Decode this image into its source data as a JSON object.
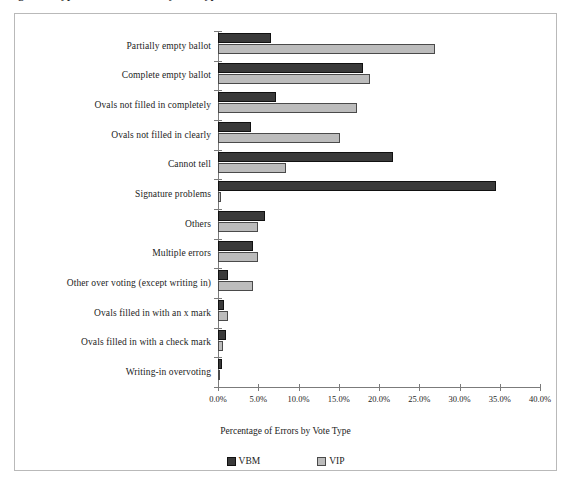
{
  "clipped_caption": "Figure 6. Types of ballot errors by vote type",
  "chart_data": {
    "type": "bar",
    "orientation": "horizontal",
    "title": "",
    "xlabel": "Percentage of Errors by Vote Type",
    "ylabel": "",
    "xlim": [
      0,
      40
    ],
    "xtick_labels": [
      "0.0%",
      "5.0%",
      "10.0%",
      "15.0%",
      "20.0%",
      "25.0%",
      "30.0%",
      "35.0%",
      "40.0%"
    ],
    "xticks": [
      0,
      5,
      10,
      15,
      20,
      25,
      30,
      35,
      40
    ],
    "grid": false,
    "legend_position": "bottom",
    "categories": [
      "Partially empty ballot",
      "Complete empty ballot",
      "Ovals not filled in completely",
      "Ovals not filled in clearly",
      "Cannot tell",
      "Signature problems",
      "Others",
      "Multiple errors",
      "Other over voting (except writing in)",
      "Ovals filled in with an x mark",
      "Ovals filled in with a check mark",
      "Writing-in overvoting"
    ],
    "series": [
      {
        "name": "VBM",
        "color": "#3A3A3A",
        "values": [
          6.6,
          18.0,
          7.2,
          4.1,
          21.7,
          34.5,
          5.8,
          4.4,
          1.2,
          0.7,
          1.0,
          0.5
        ]
      },
      {
        "name": "VIP",
        "color": "#BCBCBC",
        "values": [
          26.9,
          18.9,
          17.3,
          15.2,
          8.5,
          0.4,
          5.0,
          5.0,
          4.4,
          1.2,
          0.6,
          0.1
        ]
      }
    ]
  },
  "legend": {
    "entries": [
      {
        "label": "VBM",
        "swatch": "vbm"
      },
      {
        "label": "VIP",
        "swatch": "vip"
      }
    ]
  }
}
